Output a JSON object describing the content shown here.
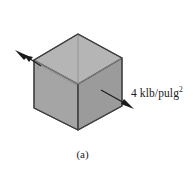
{
  "figure": {
    "caption": "(a)",
    "background_color": "#ffffff",
    "stress_label": {
      "value": "4",
      "unit_base": "klb/pulg",
      "unit_exponent": "2",
      "full_text": "4 klb/pulg²"
    },
    "cube": {
      "description": "isometric transparent cube under uniform normal stress",
      "top_face_color": "#b3b3b3",
      "left_face_color": "#a3a3a3",
      "right_face_color": "#9a9a9a",
      "edge_color": "#4a4a4a",
      "hidden_edge_color": "#8f8f8f"
    },
    "arrows": {
      "left": {
        "direction": "up-left",
        "color": "#1a1a1a"
      },
      "right": {
        "direction": "down-right",
        "color": "#1a1a1a"
      }
    }
  }
}
